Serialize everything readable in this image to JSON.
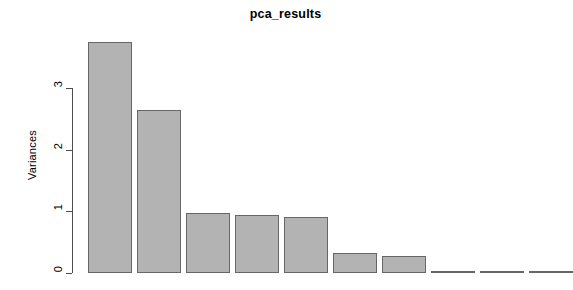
{
  "chart_data": {
    "type": "bar",
    "title": "pca_results",
    "xlabel": "",
    "ylabel": "Variances",
    "ylim": [
      0,
      3.9
    ],
    "grid": false,
    "legend": null,
    "categories": [
      "1",
      "2",
      "3",
      "4",
      "5",
      "6",
      "7",
      "8",
      "9",
      "10"
    ],
    "values": [
      3.75,
      2.64,
      0.97,
      0.94,
      0.91,
      0.32,
      0.27,
      0.04,
      0.03,
      0.02
    ],
    "y_ticks": [
      0,
      1,
      2,
      3
    ],
    "y_tick_labels": [
      "0",
      "1",
      "2",
      "3"
    ],
    "x_tick_labels": [],
    "bar_fill_color": "#b3b3b3",
    "bar_border_color": "#676767",
    "axis_color": "#4d4d4d",
    "background_color": "#ffffff"
  },
  "title": {
    "text": "pca_results"
  },
  "axes": {
    "y": {
      "label": "Variances",
      "ticks": [
        {
          "label": "3",
          "value": 3
        },
        {
          "label": "2",
          "value": 2
        },
        {
          "label": "1",
          "value": 1
        },
        {
          "label": "0",
          "value": 0
        }
      ]
    }
  },
  "bars": [
    {
      "name": "pc-1",
      "value": 3.75
    },
    {
      "name": "pc-2",
      "value": 2.64
    },
    {
      "name": "pc-3",
      "value": 0.97
    },
    {
      "name": "pc-4",
      "value": 0.94
    },
    {
      "name": "pc-5",
      "value": 0.91
    },
    {
      "name": "pc-6",
      "value": 0.32
    },
    {
      "name": "pc-7",
      "value": 0.27
    },
    {
      "name": "pc-8",
      "value": 0.04
    },
    {
      "name": "pc-9",
      "value": 0.03
    },
    {
      "name": "pc-10",
      "value": 0.02
    }
  ]
}
